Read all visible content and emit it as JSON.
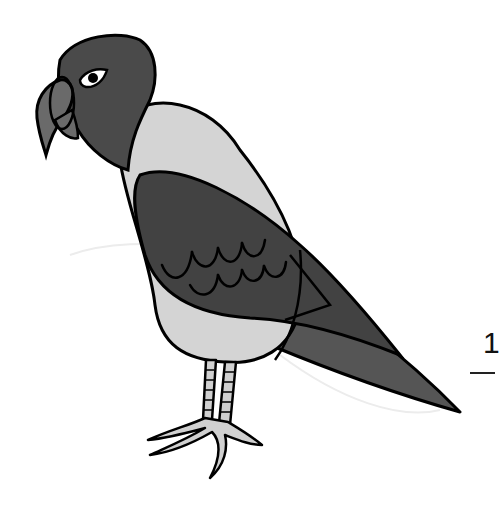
{
  "illustration": {
    "subject": "parrot",
    "colors": {
      "head": "#4a4a4a",
      "body": "#d4d4d4",
      "wing": "#424242",
      "tail": "#555555",
      "beak": "#6a6a6a",
      "legs": "#d0d0d0",
      "outline": "#000000",
      "eye_white": "#ffffff",
      "pupil": "#000000"
    }
  },
  "page": {
    "number": "1"
  }
}
